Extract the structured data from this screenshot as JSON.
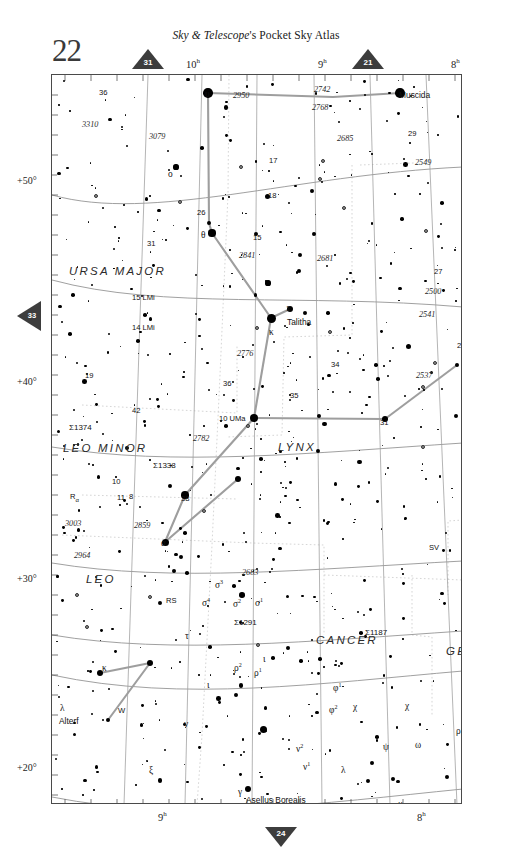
{
  "header": {
    "publication_italic": "Sky & Telescope",
    "publication_rest": "'s Pocket Sky Atlas",
    "page_number": "22"
  },
  "navigation": {
    "top_left": "31",
    "top_right": "21",
    "left": "33",
    "bottom": "24"
  },
  "axes": {
    "ra_top": [
      {
        "label": "10",
        "unit": "h",
        "x": 178
      },
      {
        "label": "9",
        "unit": "h",
        "x": 305
      },
      {
        "label": "8",
        "unit": "h",
        "x": 455
      }
    ],
    "ra_bottom": [
      {
        "label": "9",
        "unit": "h",
        "x": 160
      },
      {
        "label": "8",
        "unit": "h",
        "x": 419
      }
    ],
    "dec_left": [
      {
        "label": "+50°",
        "y": 176
      },
      {
        "label": "+40°",
        "y": 381
      },
      {
        "label": "+30°",
        "y": 578
      },
      {
        "label": "+20°",
        "y": 767
      }
    ]
  },
  "constellations": [
    {
      "name": "URSA MAJOR",
      "x": 68,
      "y": 265
    },
    {
      "name": "LEO MINOR",
      "x": 62,
      "y": 442
    },
    {
      "name": "LYNX",
      "x": 277,
      "y": 441
    },
    {
      "name": "LEO",
      "x": 85,
      "y": 573
    },
    {
      "name": "CANCER",
      "x": 315,
      "y": 634
    },
    {
      "name": "GEMINI",
      "x": 445,
      "y": 645
    }
  ],
  "named_stars": [
    {
      "name": "Muscida",
      "x": 398,
      "y": 90
    },
    {
      "name": "Talitha",
      "x": 286,
      "y": 317
    },
    {
      "name": "Pollux",
      "x": 480,
      "y": 712
    },
    {
      "name": "Alterf",
      "x": 58,
      "y": 716
    },
    {
      "name": "Asellus Borealis",
      "x": 245,
      "y": 795
    }
  ],
  "flamsteed": [
    {
      "label": "36",
      "x": 98,
      "y": 88
    },
    {
      "label": "17",
      "x": 268,
      "y": 156
    },
    {
      "label": "18",
      "x": 267,
      "y": 191
    },
    {
      "label": "26",
      "x": 196,
      "y": 208
    },
    {
      "label": "15",
      "x": 252,
      "y": 233
    },
    {
      "label": "31",
      "x": 146,
      "y": 239
    },
    {
      "label": "29",
      "x": 407,
      "y": 129
    },
    {
      "label": "24",
      "x": 503,
      "y": 140
    },
    {
      "label": "27",
      "x": 433,
      "y": 267
    },
    {
      "label": "26",
      "x": 456,
      "y": 341
    },
    {
      "label": "15 LMi",
      "x": 131,
      "y": 293
    },
    {
      "label": "14 LMi",
      "x": 131,
      "y": 323
    },
    {
      "label": "1",
      "x": 285,
      "y": 304
    },
    {
      "label": "34",
      "x": 330,
      "y": 360
    },
    {
      "label": "36",
      "x": 222,
      "y": 379
    },
    {
      "label": "35",
      "x": 289,
      "y": 391
    },
    {
      "label": "19",
      "x": 84,
      "y": 371
    },
    {
      "label": "42",
      "x": 131,
      "y": 406
    },
    {
      "label": "31",
      "x": 379,
      "y": 418
    },
    {
      "label": "10 UMa",
      "x": 218,
      "y": 414
    },
    {
      "label": "10",
      "x": 111,
      "y": 477
    },
    {
      "label": "11",
      "x": 116,
      "y": 493
    },
    {
      "label": "8",
      "x": 128,
      "y": 492
    },
    {
      "label": "38",
      "x": 180,
      "y": 494
    },
    {
      "label": "76",
      "x": 485,
      "y": 744
    }
  ],
  "ngc": [
    {
      "label": "2950",
      "x": 232,
      "y": 91
    },
    {
      "label": "2742",
      "x": 313,
      "y": 85
    },
    {
      "label": "2768",
      "x": 311,
      "y": 103
    },
    {
      "label": "3310",
      "x": 81,
      "y": 120
    },
    {
      "label": "3079",
      "x": 148,
      "y": 132
    },
    {
      "label": "2685",
      "x": 336,
      "y": 134
    },
    {
      "label": "2549",
      "x": 414,
      "y": 158
    },
    {
      "label": "2841",
      "x": 238,
      "y": 251
    },
    {
      "label": "2681",
      "x": 316,
      "y": 254
    },
    {
      "label": "2500",
      "x": 424,
      "y": 287
    },
    {
      "label": "2541",
      "x": 418,
      "y": 310
    },
    {
      "label": "2776",
      "x": 236,
      "y": 349
    },
    {
      "label": "2537",
      "x": 415,
      "y": 371
    },
    {
      "label": "2782",
      "x": 192,
      "y": 434
    },
    {
      "label": "3003",
      "x": 64,
      "y": 519
    },
    {
      "label": "2859",
      "x": 133,
      "y": 521
    },
    {
      "label": "2964",
      "x": 73,
      "y": 551
    },
    {
      "label": "2683",
      "x": 241,
      "y": 568
    }
  ],
  "doubles": [
    {
      "label": "Σ1374",
      "x": 68,
      "y": 423
    },
    {
      "label": "Σ1338",
      "x": 152,
      "y": 461
    },
    {
      "label": "Σ1291",
      "x": 233,
      "y": 618
    },
    {
      "label": "Σ1187",
      "x": 364,
      "y": 628
    }
  ],
  "greek_stars": [
    {
      "label": "υ",
      "x": 204,
      "y": 89
    },
    {
      "label": "ο",
      "x": 167,
      "y": 169
    },
    {
      "label": "θ",
      "x": 200,
      "y": 230
    },
    {
      "label": "κ",
      "x": 268,
      "y": 327
    },
    {
      "label": "α",
      "x": 160,
      "y": 538
    },
    {
      "label": "σ",
      "sup": "3",
      "x": 214,
      "y": 578
    },
    {
      "label": "σ",
      "sup": "4",
      "x": 201,
      "y": 596
    },
    {
      "label": "σ",
      "sup": "2",
      "x": 232,
      "y": 597
    },
    {
      "label": "σ",
      "sup": "1",
      "x": 254,
      "y": 596
    },
    {
      "label": "τ",
      "x": 184,
      "y": 631
    },
    {
      "label": "κ",
      "x": 101,
      "y": 663
    },
    {
      "label": "λ",
      "x": 59,
      "y": 703
    },
    {
      "label": "ξ",
      "x": 148,
      "y": 765
    },
    {
      "label": "ρ",
      "sup": "2",
      "x": 233,
      "y": 661
    },
    {
      "label": "ρ",
      "sup": "1",
      "x": 253,
      "y": 666
    },
    {
      "label": "ι",
      "x": 262,
      "y": 654
    },
    {
      "label": "ν",
      "x": 183,
      "y": 719
    },
    {
      "label": "γ",
      "x": 237,
      "y": 787
    },
    {
      "label": "φ",
      "sup": "1",
      "x": 332,
      "y": 681
    },
    {
      "label": "φ",
      "sup": "2",
      "x": 328,
      "y": 703
    },
    {
      "label": "χ",
      "x": 352,
      "y": 702
    },
    {
      "label": "χ",
      "x": 404,
      "y": 701
    },
    {
      "label": "ψ",
      "x": 382,
      "y": 742
    },
    {
      "label": "ω",
      "x": 414,
      "y": 740
    },
    {
      "label": "ν",
      "sup": "2",
      "x": 295,
      "y": 742
    },
    {
      "label": "ν",
      "sup": "1",
      "x": 302,
      "y": 760
    },
    {
      "label": "λ",
      "x": 340,
      "y": 765
    },
    {
      "label": "μ",
      "x": 397,
      "y": 799
    },
    {
      "label": "π",
      "x": 490,
      "y": 593
    },
    {
      "label": "σ",
      "x": 497,
      "y": 675
    },
    {
      "label": "β",
      "x": 496,
      "y": 695
    },
    {
      "label": "ρ",
      "x": 455,
      "y": 726
    },
    {
      "label": "κ",
      "x": 478,
      "y": 757
    },
    {
      "label": "ι",
      "x": 206,
      "y": 680
    }
  ],
  "variables": [
    {
      "label": "R",
      "sub": "α",
      "x": 69,
      "y": 492
    },
    {
      "label": "RS",
      "x": 165,
      "y": 596
    },
    {
      "label": "SV",
      "x": 428,
      "y": 543
    },
    {
      "label": "W",
      "x": 117,
      "y": 706
    },
    {
      "label": "T(c)",
      "x": 167,
      "y": 801
    }
  ],
  "colors": {
    "border": "#4a4a4a",
    "star": "#000000",
    "constellation_line": "#9a9a9a",
    "grid": "#b8b8b8",
    "ecliptic": "#8a8a8a",
    "boundary": "#c0c0c0",
    "page_bg": "#ffffff"
  }
}
